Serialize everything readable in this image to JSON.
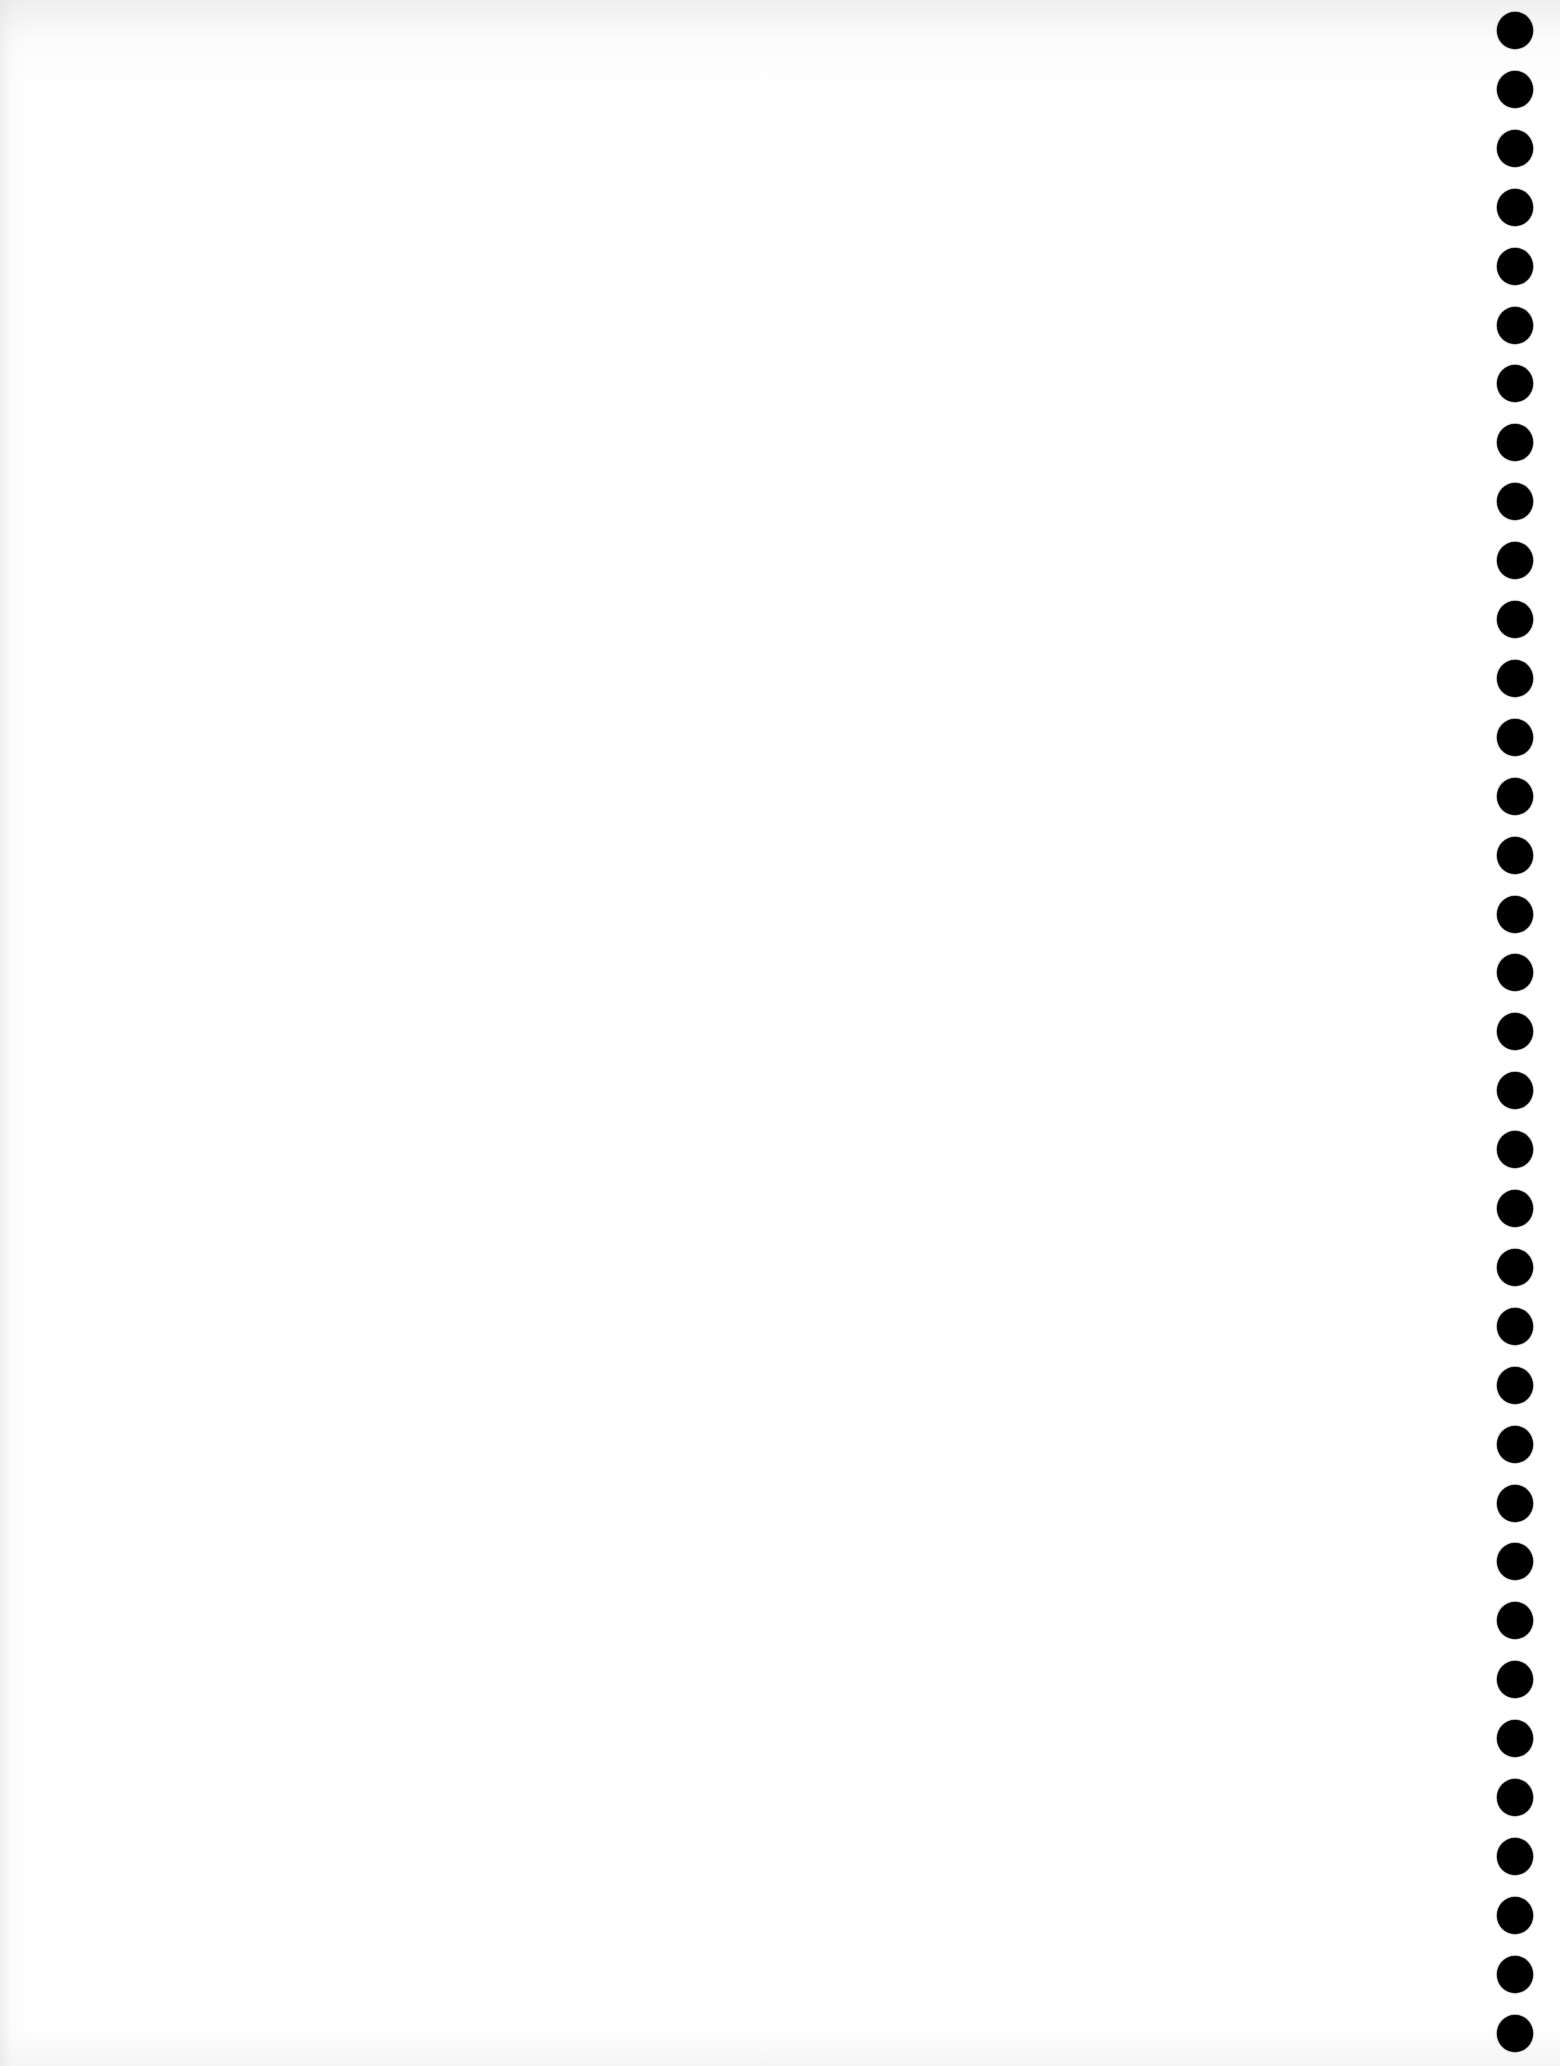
{
  "page": {
    "type": "scanned-blank-sheet",
    "text_content": "",
    "background_color": "#ffffff",
    "hole_color": "#000000"
  },
  "punch_holes": {
    "count": 35,
    "side": "right",
    "center_x": 1515,
    "first_center_y": 30,
    "spacing": 58.9,
    "diameter": 36
  }
}
